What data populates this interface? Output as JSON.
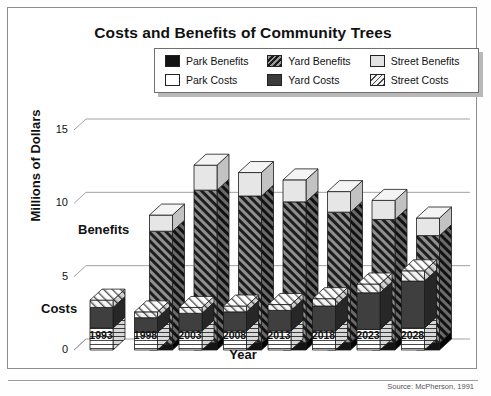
{
  "title": "Costs and Benefits of Community Trees",
  "source": "Source: McPherson, 1991",
  "legend": {
    "items": [
      {
        "label": "Park Benefits",
        "swatch": "black",
        "key": "park_benefits"
      },
      {
        "label": "Yard Benefits",
        "swatch": "hatch-dark",
        "key": "yard_benefits"
      },
      {
        "label": "Street Benefits",
        "swatch": "lightgray",
        "key": "street_benefits"
      },
      {
        "label": "Park Costs",
        "swatch": "white",
        "key": "park_costs"
      },
      {
        "label": "Yard Costs",
        "swatch": "dark",
        "key": "yard_costs"
      },
      {
        "label": "Street Costs",
        "swatch": "hatch-light",
        "key": "street_costs"
      }
    ]
  },
  "annotations": {
    "benefits": "Benefits",
    "costs": "Costs"
  },
  "chart_data": {
    "type": "bar",
    "subtype": "3d-stacked-grouped",
    "title": "Costs and Benefits of Community Trees",
    "xlabel": "Year",
    "ylabel": "Millions of Dollars",
    "ylim": [
      0,
      15
    ],
    "yticks": [
      0,
      5,
      10,
      15
    ],
    "ytick_labels": [
      "0",
      "5",
      "10",
      "15"
    ],
    "grid": true,
    "legend_position": "top-center",
    "categories": [
      "1993",
      "1998",
      "2003",
      "2008",
      "2013",
      "2018",
      "2023",
      "2028"
    ],
    "groups": [
      {
        "name": "Benefits",
        "stack_order": [
          "Park Benefits",
          "Yard Benefits",
          "Street Benefits"
        ],
        "series": [
          {
            "name": "Park Benefits",
            "values": [
              0.0,
              0.4,
              0.5,
              0.5,
              0.5,
              0.5,
              0.5,
              0.5
            ]
          },
          {
            "name": "Yard Benefits",
            "values": [
              0.0,
              7.7,
              10.4,
              10.0,
              9.6,
              8.9,
              8.4,
              7.3
            ]
          },
          {
            "name": "Street Benefits",
            "values": [
              0.0,
              1.1,
              1.7,
              1.6,
              1.5,
              1.4,
              1.3,
              1.2
            ]
          }
        ],
        "totals": [
          0.0,
          9.2,
          12.6,
          12.1,
          11.6,
          10.8,
          10.2,
          9.0
        ]
      },
      {
        "name": "Costs",
        "stack_order": [
          "Park Costs",
          "Yard Costs",
          "Street Costs"
        ],
        "series": [
          {
            "name": "Park Costs",
            "values": [
              1.5,
              1.2,
              1.3,
              1.3,
              1.3,
              1.3,
              1.4,
              1.5
            ]
          },
          {
            "name": "Yard Costs",
            "values": [
              1.4,
              1.0,
              1.2,
              1.3,
              1.4,
              1.7,
              2.5,
              3.2
            ]
          },
          {
            "name": "Street Costs",
            "values": [
              0.5,
              0.4,
              0.4,
              0.4,
              0.4,
              0.5,
              0.6,
              0.7
            ]
          }
        ],
        "totals": [
          3.4,
          2.6,
          2.9,
          3.0,
          3.1,
          3.5,
          4.5,
          5.4
        ]
      }
    ]
  }
}
